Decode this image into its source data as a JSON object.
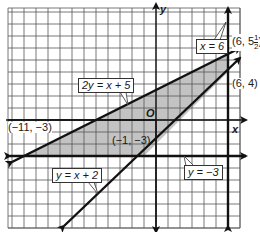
{
  "graph": {
    "origin_px": [
      156,
      120
    ],
    "unit_px": 12,
    "x_range": [
      -12.33,
      7
    ],
    "y_range": [
      -9,
      9.33
    ],
    "axis_labels": {
      "x": "x",
      "y": "y",
      "origin": "O"
    },
    "colors": {
      "grid": "#555555",
      "lines": "#111111",
      "shade": "#b8b8b8",
      "background": "#ffffff"
    }
  },
  "lines": [
    {
      "equation": "2y = x + 5",
      "label": "2y = x + 5"
    },
    {
      "equation": "y = x + 2",
      "label": "y = x + 2"
    },
    {
      "equation": "y = -3",
      "label": "y = −3"
    },
    {
      "equation": "x = 6",
      "label": "x = 6"
    }
  ],
  "points": [
    {
      "label": "(−11, −3)",
      "x": -11,
      "y": -3
    },
    {
      "label": "(−1, −3)",
      "x": -1,
      "y": -3
    },
    {
      "label_prefix": "(6, 5",
      "label_frac_num": "1",
      "label_frac_den": "2",
      "label_suffix": ")",
      "x": 6,
      "y": 5.5
    },
    {
      "label": "(6, 4)",
      "x": 6,
      "y": 4
    }
  ],
  "region": {
    "description": "shaded region bounded by 2y = x + 5 (above), y = -3 and y = x + 2 (below), extending right to x = 6",
    "vertices": [
      [
        -11,
        -3
      ],
      [
        -1,
        -3
      ],
      [
        6,
        4
      ],
      [
        6,
        5.5
      ]
    ]
  }
}
